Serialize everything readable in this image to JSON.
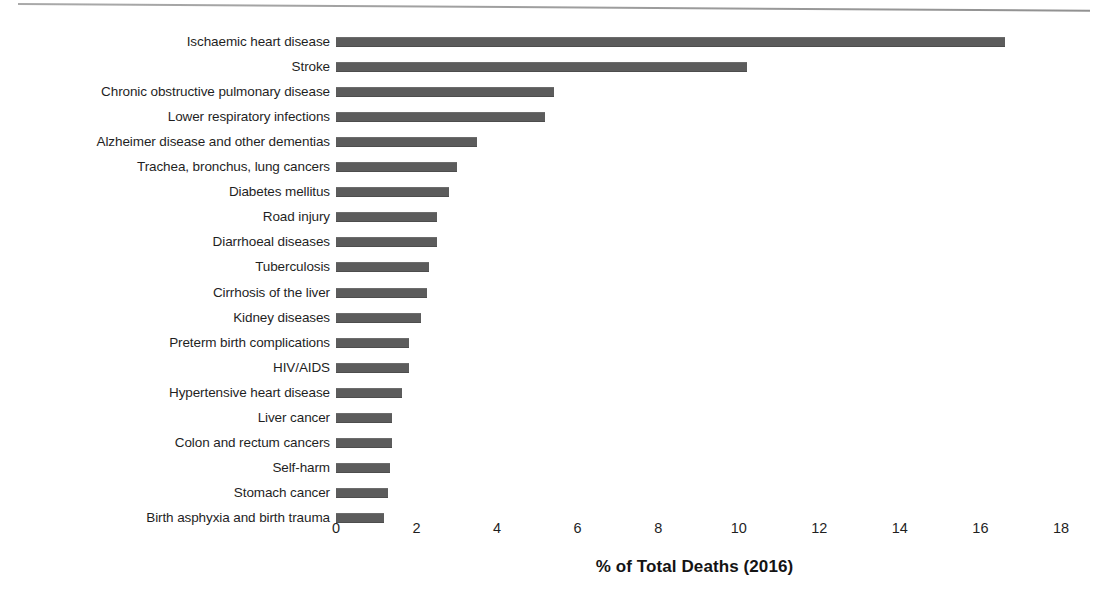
{
  "chart_data": {
    "type": "bar",
    "orientation": "horizontal",
    "title": "",
    "xlabel": "% of Total Deaths (2016)",
    "ylabel": "",
    "xlim": [
      0,
      18
    ],
    "xticks": [
      0,
      2,
      4,
      6,
      8,
      10,
      12,
      14,
      16,
      18
    ],
    "grid": false,
    "legend": null,
    "bar_color": "#5c5c5c",
    "background_color": "#ffffff",
    "categories": [
      "Ischaemic heart disease",
      "Stroke",
      "Chronic obstructive pulmonary disease",
      "Lower respiratory infections",
      "Alzheimer disease and other dementias",
      "Trachea, bronchus, lung cancers",
      "Diabetes mellitus",
      "Road injury",
      "Diarrhoeal diseases",
      "Tuberculosis",
      "Cirrhosis of the liver",
      "Kidney diseases",
      "Preterm birth complications",
      "HIV/AIDS",
      "Hypertensive heart disease",
      "Liver cancer",
      "Colon and rectum cancers",
      "Self-harm",
      "Stomach cancer",
      "Birth asphyxia and birth trauma"
    ],
    "values": [
      16.6,
      10.2,
      5.4,
      5.2,
      3.5,
      3.0,
      2.8,
      2.5,
      2.5,
      2.3,
      2.25,
      2.1,
      1.8,
      1.8,
      1.65,
      1.4,
      1.4,
      1.35,
      1.3,
      1.2
    ]
  }
}
